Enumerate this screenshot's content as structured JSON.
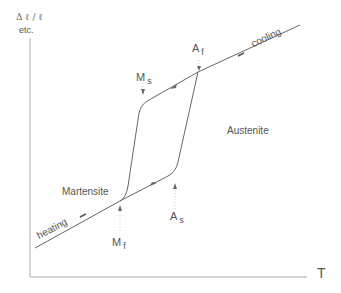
{
  "diagram": {
    "y_axis": {
      "label_top": "Δ ℓ / ℓ",
      "label_sub": "etc."
    },
    "x_axis": {
      "label": "T"
    },
    "regions": {
      "austenite": "Austenite",
      "martensite": "Martensite"
    },
    "processes": {
      "heating": "heating",
      "cooling": "cooling"
    },
    "temperatures": {
      "ms": {
        "main": "M",
        "sub": "s"
      },
      "mf": {
        "main": "M",
        "sub": "f"
      },
      "as": {
        "main": "A",
        "sub": "s"
      },
      "af": {
        "main": "A",
        "sub": "f"
      }
    },
    "colors": {
      "line": "#555555",
      "axis": "#999999",
      "text": "#555555"
    }
  }
}
